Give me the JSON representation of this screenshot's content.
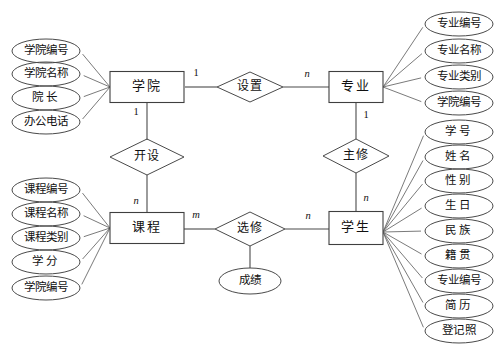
{
  "diagram": {
    "entities": [
      {
        "id": "college",
        "label": "学院",
        "x": 147,
        "y": 87,
        "w": 74,
        "h": 31
      },
      {
        "id": "major",
        "label": "专业",
        "x": 356,
        "y": 87,
        "w": 54,
        "h": 31
      },
      {
        "id": "course",
        "label": "课程",
        "x": 147,
        "y": 228,
        "w": 74,
        "h": 31
      },
      {
        "id": "student",
        "label": "学生",
        "x": 356,
        "y": 228,
        "w": 54,
        "h": 33
      }
    ],
    "relationships": [
      {
        "id": "setup",
        "label": "设置",
        "x": 250,
        "y": 87,
        "rx": 33,
        "ry": 15
      },
      {
        "id": "offer",
        "label": "开设",
        "x": 147,
        "y": 157,
        "rx": 37,
        "ry": 18
      },
      {
        "id": "major_in",
        "label": "主修",
        "x": 356,
        "y": 156,
        "rx": 33,
        "ry": 17
      },
      {
        "id": "elective",
        "label": "选修",
        "x": 250,
        "y": 229,
        "rx": 35,
        "ry": 17
      }
    ],
    "relationship_attributes": [
      {
        "id": "grade",
        "label": "成绩",
        "owner": "elective",
        "x": 250,
        "y": 281,
        "rx": 31,
        "ry": 13
      }
    ],
    "attribute_groups": [
      {
        "owner": "college",
        "side": "left",
        "anchor": {
          "x": 110,
          "y": 87
        },
        "attributes": [
          {
            "id": "college_no",
            "label": "学院编号",
            "x": 46,
            "y": 51,
            "rx": 34,
            "ry": 12,
            "spaced": false
          },
          {
            "id": "college_name",
            "label": "学院名称",
            "x": 46,
            "y": 74,
            "rx": 34,
            "ry": 12,
            "spaced": false
          },
          {
            "id": "dean",
            "label": "院长",
            "x": 46,
            "y": 98,
            "rx": 34,
            "ry": 12,
            "spaced": true
          },
          {
            "id": "office_phone",
            "label": "办公电话",
            "x": 46,
            "y": 122,
            "rx": 34,
            "ry": 12,
            "spaced": false
          }
        ]
      },
      {
        "owner": "course",
        "side": "left",
        "anchor": {
          "x": 110,
          "y": 228
        },
        "attributes": [
          {
            "id": "course_no",
            "label": "课程编号",
            "x": 46,
            "y": 190,
            "rx": 34,
            "ry": 12,
            "spaced": false
          },
          {
            "id": "course_name",
            "label": "课程名称",
            "x": 46,
            "y": 214,
            "rx": 34,
            "ry": 12,
            "spaced": false
          },
          {
            "id": "course_type",
            "label": "课程类别",
            "x": 46,
            "y": 238,
            "rx": 34,
            "ry": 12,
            "spaced": false
          },
          {
            "id": "credits",
            "label": "学分",
            "x": 46,
            "y": 262,
            "rx": 34,
            "ry": 12,
            "spaced": true
          },
          {
            "id": "course_college",
            "label": "学院编号",
            "x": 46,
            "y": 288,
            "rx": 34,
            "ry": 12,
            "spaced": false
          }
        ]
      },
      {
        "owner": "major",
        "side": "right",
        "anchor": {
          "x": 383,
          "y": 87
        },
        "attributes": [
          {
            "id": "major_no",
            "label": "专业编号",
            "x": 459,
            "y": 24,
            "rx": 34,
            "ry": 12,
            "spaced": false
          },
          {
            "id": "major_name",
            "label": "专业名称",
            "x": 459,
            "y": 51,
            "rx": 34,
            "ry": 12,
            "spaced": false
          },
          {
            "id": "major_type",
            "label": "专业类别",
            "x": 459,
            "y": 77,
            "rx": 34,
            "ry": 12,
            "spaced": false
          },
          {
            "id": "major_college",
            "label": "学院编号",
            "x": 459,
            "y": 103,
            "rx": 34,
            "ry": 12,
            "spaced": false
          }
        ]
      },
      {
        "owner": "student",
        "side": "right",
        "anchor": {
          "x": 383,
          "y": 232
        },
        "attributes": [
          {
            "id": "student_no",
            "label": "学号",
            "x": 459,
            "y": 132,
            "rx": 34,
            "ry": 12,
            "spaced": true
          },
          {
            "id": "student_name",
            "label": "姓名",
            "x": 459,
            "y": 157,
            "rx": 34,
            "ry": 12,
            "spaced": true
          },
          {
            "id": "gender",
            "label": "性别",
            "x": 459,
            "y": 181,
            "rx": 34,
            "ry": 12,
            "spaced": true
          },
          {
            "id": "birthday",
            "label": "生日",
            "x": 459,
            "y": 206,
            "rx": 34,
            "ry": 12,
            "spaced": true
          },
          {
            "id": "ethnicity",
            "label": "民族",
            "x": 459,
            "y": 231,
            "rx": 34,
            "ry": 12,
            "spaced": true
          },
          {
            "id": "native_place",
            "label": "籍贯",
            "x": 459,
            "y": 256,
            "rx": 34,
            "ry": 12,
            "spaced": true
          },
          {
            "id": "student_major",
            "label": "专业编号",
            "x": 459,
            "y": 281,
            "rx": 34,
            "ry": 12,
            "spaced": false
          },
          {
            "id": "resume",
            "label": "简历",
            "x": 459,
            "y": 306,
            "rx": 34,
            "ry": 12,
            "spaced": true
          },
          {
            "id": "photo",
            "label": "登记照",
            "x": 459,
            "y": 331,
            "rx": 34,
            "ry": 12,
            "spaced": false
          }
        ]
      }
    ],
    "cardinalities": [
      {
        "id": "college-setup",
        "label": "1",
        "x": 196,
        "y": 74,
        "italic": false
      },
      {
        "id": "setup-major",
        "label": "n",
        "x": 307,
        "y": 75,
        "italic": true
      },
      {
        "id": "college-offer",
        "label": "1",
        "x": 136,
        "y": 113,
        "italic": false
      },
      {
        "id": "offer-course",
        "label": "n",
        "x": 136,
        "y": 202,
        "italic": true
      },
      {
        "id": "major-majorin",
        "label": "1",
        "x": 366,
        "y": 116,
        "italic": false
      },
      {
        "id": "majorin-student",
        "label": "n",
        "x": 366,
        "y": 199,
        "italic": true
      },
      {
        "id": "course-elective",
        "label": "m",
        "x": 196,
        "y": 216,
        "italic": true
      },
      {
        "id": "elective-student",
        "label": "n",
        "x": 308,
        "y": 217,
        "italic": true
      }
    ],
    "edges": [
      {
        "id": "edge-college-setup",
        "from": "college",
        "to": "setup",
        "d": "M185,87 L217,87"
      },
      {
        "id": "edge-setup-major",
        "from": "setup",
        "to": "major",
        "d": "M283,87 L329,87"
      },
      {
        "id": "edge-college-offer",
        "from": "college",
        "to": "offer",
        "d": "M147,103 L147,140"
      },
      {
        "id": "edge-offer-course",
        "from": "offer",
        "to": "course",
        "d": "M147,175 L147,212"
      },
      {
        "id": "edge-major-majorin",
        "from": "major",
        "to": "majorin",
        "d": "M356,103 L356,139"
      },
      {
        "id": "edge-majorin-student",
        "from": "majorin",
        "to": "student",
        "d": "M356,173 L356,212"
      },
      {
        "id": "edge-course-elective",
        "from": "course",
        "to": "elective",
        "d": "M184,229 L215,229"
      },
      {
        "id": "edge-elective-student",
        "from": "elective",
        "to": "student",
        "d": "M285,229 L329,229"
      },
      {
        "id": "edge-elective-grade",
        "from": "elective",
        "to": "grade",
        "d": "M250,246 L250,268"
      }
    ],
    "colors": {
      "background": "#ffffff",
      "stroke": "#4a4a4a",
      "connector": "#6b6b6b",
      "text": "#111111"
    }
  }
}
